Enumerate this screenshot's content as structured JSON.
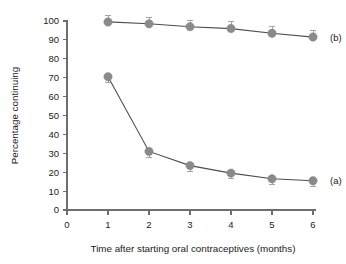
{
  "chart_data": {
    "type": "line",
    "title": "",
    "xlabel": "Time after starting oral contraceptives (months)",
    "ylabel": "Percentage continuing",
    "x": [
      1,
      2,
      3,
      4,
      5,
      6
    ],
    "xlim": [
      0,
      6
    ],
    "ylim": [
      0,
      100
    ],
    "xticks": [
      "0",
      "1",
      "2",
      "3",
      "4",
      "5",
      "6"
    ],
    "yticks": [
      "0",
      "10",
      "20",
      "30",
      "40",
      "50",
      "60",
      "70",
      "80",
      "90",
      "100"
    ],
    "grid": false,
    "legend_position": "inline-right",
    "marker_color": "#8a8a8a",
    "line_color": "#4d4d4d",
    "errorbar_color": "#9a9a9a",
    "series": [
      {
        "name": "(b)",
        "label": "(b)",
        "errorbar_direction": "up",
        "values": [
          99.5,
          98.5,
          97.0,
          96.0,
          93.5,
          91.5
        ],
        "errors": [
          3.5,
          3.5,
          3.5,
          3.5,
          3.5,
          3.5
        ]
      },
      {
        "name": "(a)",
        "label": "(a)",
        "errorbar_direction": "down",
        "values": [
          70.5,
          31.0,
          23.5,
          19.5,
          16.5,
          15.5
        ],
        "errors": [
          3.0,
          3.0,
          3.0,
          3.0,
          3.0,
          3.0
        ]
      }
    ]
  }
}
